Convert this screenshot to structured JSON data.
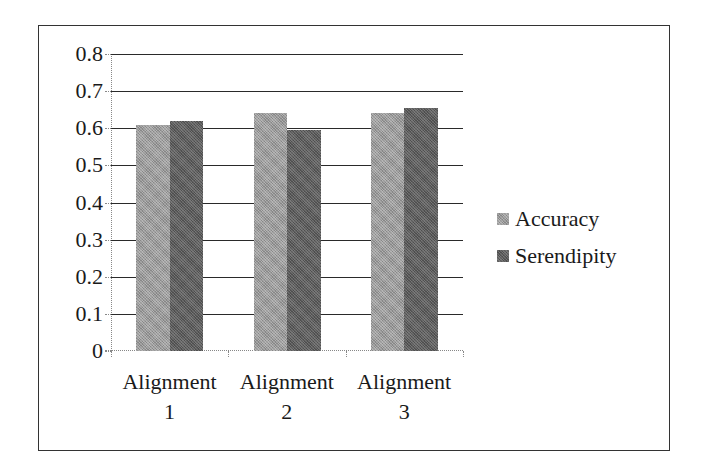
{
  "chart_data": {
    "type": "bar",
    "title": "",
    "xlabel": "",
    "ylabel": "",
    "categories": [
      "Alignment 1",
      "Alignment 2",
      "Alignment 3"
    ],
    "series": [
      {
        "name": "Accuracy",
        "values": [
          0.61,
          0.64,
          0.64
        ],
        "color": "#9a9a9a"
      },
      {
        "name": "Serendipity",
        "values": [
          0.62,
          0.595,
          0.655
        ],
        "color": "#5c5c5c"
      }
    ],
    "ylim": [
      0,
      0.8
    ],
    "yticks": [
      "0",
      "0.1",
      "0.2",
      "0.3",
      "0.4",
      "0.5",
      "0.6",
      "0.7",
      "0.8"
    ],
    "grid": true,
    "legend_position": "right"
  },
  "axis": {
    "y_ticks": [
      "0.8",
      "0.7",
      "0.6",
      "0.5",
      "0.4",
      "0.3",
      "0.2",
      "0.1",
      "0"
    ],
    "x_labels": [
      "Alignment\n1",
      "Alignment\n2",
      "Alignment\n3"
    ]
  },
  "legend": {
    "items": [
      {
        "label": "Accuracy",
        "color": "#9a9a9a"
      },
      {
        "label": "Serendipity",
        "color": "#5c5c5c"
      }
    ]
  }
}
